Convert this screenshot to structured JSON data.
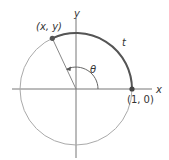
{
  "diagram": {
    "labels": {
      "point_xy": "(x, y)",
      "point_10": "(1, 0)",
      "x_axis": "x",
      "y_axis": "y",
      "angle": "θ",
      "arc": "t"
    },
    "colors": {
      "circle": "#aaaaaa",
      "arc": "#555555",
      "axes": "#777777",
      "point": "#555555",
      "radius": "#888888"
    }
  }
}
